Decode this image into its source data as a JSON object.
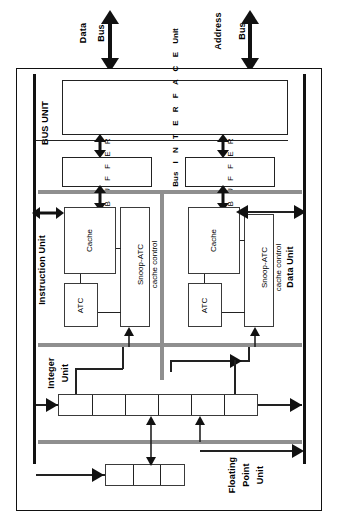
{
  "diagram": {
    "external_buses": [
      {
        "name": "data-bus",
        "line1": "Data",
        "line2": "Bus"
      },
      {
        "name": "address-bus",
        "line1": "Address",
        "line2": "Bus"
      }
    ],
    "units": {
      "bus_unit": {
        "label": "BUS UNIT"
      },
      "instruction_unit": {
        "label": "Instruction Unit"
      },
      "data_unit": {
        "label": "Data Unit"
      },
      "integer_unit": {
        "line1": "Integer",
        "line2": "Unit"
      },
      "floating_point_unit": {
        "line1": "Floating",
        "line2": "Point",
        "line3": "Unit"
      }
    },
    "bus_interface": {
      "name": "bus-interface-unit",
      "prefix": "Bus",
      "letters": [
        "I",
        "N",
        "T",
        "E",
        "R",
        "F",
        "A",
        "C",
        "E"
      ],
      "suffix": "Unit"
    },
    "buffers": [
      {
        "name": "data-buffer",
        "letters": [
          "B",
          "U",
          "F",
          "F",
          "E",
          "R"
        ]
      },
      {
        "name": "address-buffer",
        "letters": [
          "B",
          "U",
          "F",
          "F",
          "E",
          "R"
        ]
      }
    ],
    "instruction_blocks": {
      "cache": "Cache",
      "atc": "ATC",
      "snoop_line1": "Snoop-ATC",
      "snoop_line2": "cache control"
    },
    "data_blocks": {
      "cache": "Cache",
      "atc": "ATC",
      "snoop_line1": "Snoop-ATC",
      "snoop_line2": "cache control"
    },
    "pipelines": {
      "integer": {
        "name": "integer-pipeline",
        "stages": 6
      },
      "floating_point": {
        "name": "fpu-pipeline",
        "stages": 3
      }
    },
    "colors": {
      "outline": "#111111",
      "box_outline": "#3a3a3a",
      "internal_bus": "#8f8f8f",
      "background": "#ffffff"
    }
  }
}
